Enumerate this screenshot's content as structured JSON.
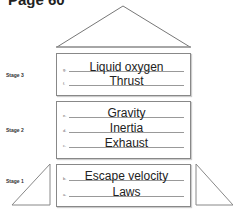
{
  "page_title": "Page 60",
  "stages": [
    {
      "label": "Stage 3",
      "rows": [
        {
          "letter": "g.",
          "answer": "Liquid oxygen"
        },
        {
          "letter": "f.",
          "answer": "Thrust"
        }
      ]
    },
    {
      "label": "Stage 2",
      "rows": [
        {
          "letter": "e.",
          "answer": "Gravity"
        },
        {
          "letter": "d.",
          "answer": "Inertia"
        },
        {
          "letter": "c.",
          "answer": "Exhaust"
        }
      ]
    },
    {
      "label": "Stage 1",
      "rows": [
        {
          "letter": "b.",
          "answer": "Escape velocity"
        },
        {
          "letter": "a.",
          "answer": "Laws"
        }
      ]
    }
  ]
}
